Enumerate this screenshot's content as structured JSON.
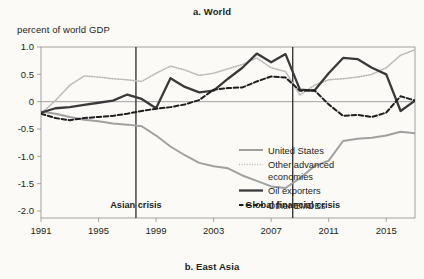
{
  "panel": {
    "title": "a. World",
    "bottom_title": "b. East Asia",
    "axis_label": "percent of world GDP"
  },
  "colors": {
    "united_states": "#a0a0a0",
    "other_advanced": "#b9b9b9",
    "oil_exporters": "#3a3a3a",
    "other_emdes": "#1f1f1f",
    "axis": "#8d8d8d",
    "text": "#231f20",
    "background": "#fbfaf7"
  },
  "chart_data": {
    "type": "line",
    "title": "a. World",
    "xlabel": "",
    "ylabel": "percent of world GDP",
    "xlim": [
      1991,
      2017
    ],
    "ylim": [
      -2.3,
      1.1
    ],
    "yticks": [
      1.0,
      0.5,
      0,
      -0.5,
      -1.0,
      -1.5,
      -2.0
    ],
    "ytick_labels": [
      "1.0",
      "0.5",
      "0",
      "-0.5",
      "-1.0",
      "-1.5",
      "-2.0"
    ],
    "xticks": [
      1991,
      1995,
      1999,
      2003,
      2007,
      2011,
      2015
    ],
    "xtick_labels": [
      "1991",
      "1995",
      "1999",
      "2003",
      "2007",
      "2011",
      "2015"
    ],
    "grid": false,
    "zero_line": true,
    "legend_position": "lower-right",
    "x": [
      1991,
      1992,
      1993,
      1994,
      1995,
      1996,
      1997,
      1998,
      1999,
      2000,
      2001,
      2002,
      2003,
      2004,
      2005,
      2006,
      2007,
      2008,
      2009,
      2010,
      2011,
      2012,
      2013,
      2014,
      2015,
      2016,
      2017
    ],
    "series": [
      {
        "name": "United States",
        "style": "solid-light",
        "values": [
          -0.18,
          -0.22,
          -0.28,
          -0.33,
          -0.36,
          -0.4,
          -0.42,
          -0.45,
          -0.62,
          -0.82,
          -0.98,
          -1.12,
          -1.18,
          -1.22,
          -1.35,
          -1.45,
          -1.55,
          -1.58,
          -1.4,
          -1.18,
          -1.08,
          -0.72,
          -0.68,
          -0.66,
          -0.62,
          -0.55,
          -0.58
        ]
      },
      {
        "name": "Other advanced economies",
        "style": "dotted-light",
        "values": [
          -0.22,
          0.02,
          0.3,
          0.47,
          0.45,
          0.42,
          0.4,
          0.37,
          0.52,
          0.65,
          0.58,
          0.48,
          0.52,
          0.6,
          0.68,
          0.8,
          0.62,
          0.55,
          0.12,
          0.3,
          0.4,
          0.42,
          0.45,
          0.5,
          0.62,
          0.85,
          0.95
        ]
      },
      {
        "name": "Oil exporters",
        "style": "solid-dark",
        "values": [
          -0.2,
          -0.12,
          -0.1,
          -0.06,
          -0.02,
          0.02,
          0.13,
          0.05,
          -0.12,
          0.43,
          0.27,
          0.17,
          0.2,
          0.42,
          0.62,
          0.88,
          0.72,
          0.87,
          0.22,
          0.2,
          0.52,
          0.8,
          0.78,
          0.62,
          0.5,
          -0.17,
          0.02
        ]
      },
      {
        "name": "Other EMDEs",
        "style": "dashed-dark",
        "values": [
          -0.22,
          -0.3,
          -0.34,
          -0.3,
          -0.28,
          -0.26,
          -0.22,
          -0.17,
          -0.13,
          -0.1,
          -0.05,
          0.03,
          0.22,
          0.25,
          0.26,
          0.37,
          0.46,
          0.44,
          0.2,
          0.21,
          -0.05,
          -0.26,
          -0.24,
          -0.28,
          -0.2,
          0.1,
          0.02
        ]
      }
    ],
    "annotations": [
      {
        "label": "Asian crisis",
        "x": 1997.6
      },
      {
        "label": "Global financial crisis",
        "x": 2008.5
      }
    ]
  },
  "legend": {
    "items": [
      {
        "label": "United States"
      },
      {
        "label": "Other advanced"
      },
      {
        "label": "economies"
      },
      {
        "label": "Oil exporters"
      },
      {
        "label": "Other EMDEs"
      }
    ]
  }
}
